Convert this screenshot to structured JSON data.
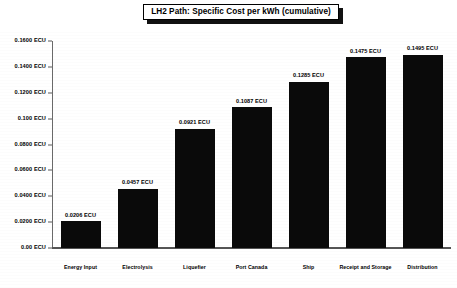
{
  "chart_data": {
    "type": "bar",
    "title": "LH2 Path: Specific Cost per kWh (cumulative)",
    "xlabel": "",
    "ylabel": "",
    "ylim": [
      0,
      0.16
    ],
    "grid": false,
    "legend": "none",
    "units": "ECU",
    "categories": [
      "Energy Input",
      "Electrolysis",
      "Liquefier",
      "Port Canada",
      "Ship",
      "Receipt and Storage",
      "Distribution"
    ],
    "values": [
      0.0206,
      0.0457,
      0.0921,
      0.1087,
      0.1285,
      0.1475,
      0.1495
    ],
    "data_labels": [
      "0.0206 ECU",
      "0.0457 ECU",
      "0.0921 ECU",
      "0.1087 ECU",
      "0.1285 ECU",
      "0.1475 ECU",
      "0.1495 ECU"
    ],
    "yticks": [
      0,
      0.02,
      0.04,
      0.06,
      0.08,
      0.1,
      0.12,
      0.14,
      0.16
    ],
    "ytick_labels": [
      "0.00 ECU",
      "0.0200 ECU",
      "0.0400 ECU",
      "0.0600 ECU",
      "0.0800 ECU",
      "0.100 ECU",
      "0.1200 ECU",
      "0.1400 ECU",
      "0.1600 ECU"
    ],
    "colors": {
      "bar": "#0a0a0a",
      "axis": "#555555",
      "background": "#ffffff",
      "text": "#000000"
    }
  }
}
